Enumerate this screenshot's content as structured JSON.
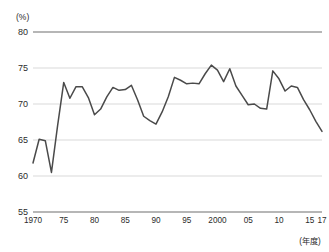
{
  "chart_data": {
    "type": "line",
    "title": "",
    "subtitle": "",
    "xlabel": "(年度)",
    "ylabel": "(%)",
    "unit_label": "(%)",
    "x_axis_caption": "(年度)",
    "grid": true,
    "legend": "none",
    "xlim": [
      1970,
      2017
    ],
    "ylim": [
      55,
      80
    ],
    "y_ticks": [
      80,
      75,
      70,
      65,
      60,
      55
    ],
    "y_tick_labels": [
      "80",
      "75",
      "70",
      "65",
      "60",
      "55"
    ],
    "x_ticks": [
      1970,
      1975,
      1980,
      1985,
      1990,
      1995,
      2000,
      2005,
      2010,
      2015,
      2017
    ],
    "x_tick_labels": [
      "1970",
      "75",
      "80",
      "85",
      "90",
      "95",
      "2000",
      "05",
      "10",
      "15",
      "17"
    ],
    "line_color": "#4a4a4a",
    "grid_color": "#c8c8c8",
    "axis_color": "#6e6e6e",
    "series": [
      {
        "name": "",
        "x": [
          1970,
          1971,
          1972,
          1973,
          1974,
          1975,
          1976,
          1977,
          1978,
          1979,
          1980,
          1981,
          1982,
          1983,
          1984,
          1985,
          1986,
          1987,
          1988,
          1989,
          1990,
          1991,
          1992,
          1993,
          1994,
          1995,
          1996,
          1997,
          1998,
          1999,
          2000,
          2001,
          2002,
          2003,
          2004,
          2005,
          2006,
          2007,
          2008,
          2009,
          2010,
          2011,
          2012,
          2013,
          2014,
          2015,
          2016,
          2017
        ],
        "values": [
          61.8,
          65.1,
          64.9,
          60.5,
          67.0,
          73.0,
          70.8,
          72.4,
          72.4,
          70.9,
          68.5,
          69.3,
          71.0,
          72.3,
          71.9,
          72.0,
          72.6,
          70.6,
          68.3,
          67.7,
          67.2,
          68.9,
          71.0,
          73.7,
          73.3,
          72.8,
          72.9,
          72.8,
          74.2,
          75.4,
          74.7,
          73.1,
          74.9,
          72.5,
          71.2,
          69.9,
          70.0,
          69.4,
          69.3,
          74.6,
          73.5,
          71.8,
          72.5,
          72.3,
          70.6,
          69.2,
          67.6,
          66.2
        ]
      }
    ]
  }
}
